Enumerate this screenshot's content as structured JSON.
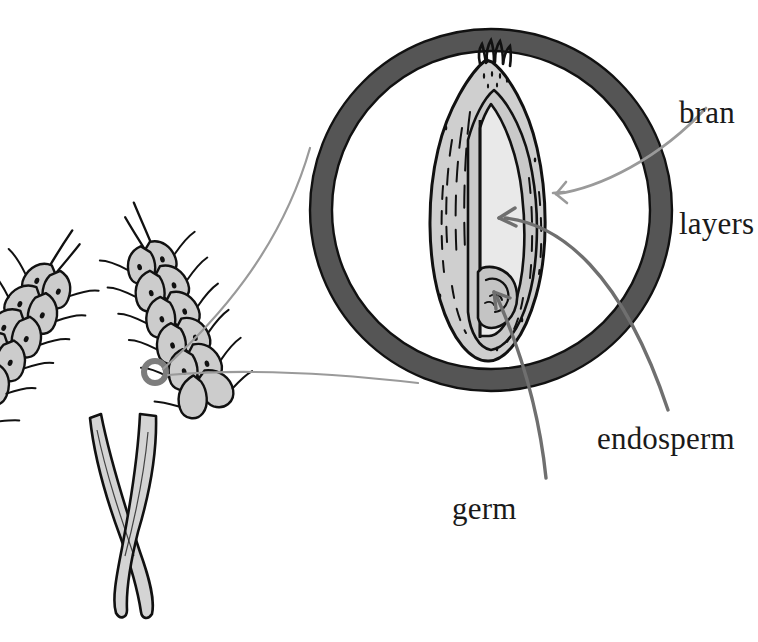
{
  "diagram": {
    "labels": [
      {
        "id": "bran",
        "text": "bran\nlayers",
        "line1": "bran",
        "line2": "layers"
      },
      {
        "id": "endosperm",
        "text": "endosperm"
      },
      {
        "id": "germ",
        "text": "germ"
      }
    ],
    "colors": {
      "outline": "#111111",
      "magnifier_ring": "#555555",
      "bran_fill": "#cfcfcf",
      "endosperm_fill": "#e9e9e9",
      "germ_fill": "#c4c4c4",
      "wheat_fill": "#cccccc",
      "stem_fill": "#d4d4d4",
      "leader_light": "#9a9a9a",
      "leader_dark": "#6f6f6f",
      "background": "#ffffff",
      "text": "#1a1a1a"
    },
    "magnifier": {
      "cx": 491,
      "cy": 210,
      "r_outer": 181,
      "ring_width": 22
    },
    "callouts": [
      {
        "id": "bran",
        "arrow_x": 553,
        "arrow_y": 194,
        "tone": "light"
      },
      {
        "id": "endosperm",
        "arrow_x": 499,
        "arrow_y": 218,
        "tone": "dark"
      },
      {
        "id": "germ",
        "arrow_x": 494,
        "arrow_y": 293,
        "tone": "dark"
      }
    ],
    "marker": {
      "label": "kernel-location-marker",
      "cx": 155,
      "cy": 372,
      "r": 11
    }
  }
}
